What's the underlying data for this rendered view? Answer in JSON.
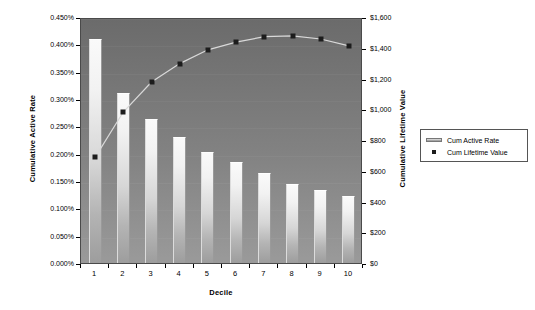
{
  "chart_data": {
    "type": "bar",
    "title": "",
    "xlabel": "Decile",
    "ylabel": "Cumulative Active Rate",
    "y2label": "Cumulative Lifetime Value",
    "categories": [
      "1",
      "2",
      "3",
      "4",
      "5",
      "6",
      "7",
      "8",
      "9",
      "10"
    ],
    "grid": false,
    "legend_position": "right",
    "ylim": [
      0,
      0.0045
    ],
    "y2lim": [
      0,
      1600
    ],
    "yticks": [
      "0.000%",
      "0.050%",
      "0.100%",
      "0.150%",
      "0.200%",
      "0.250%",
      "0.300%",
      "0.350%",
      "0.400%",
      "0.450%"
    ],
    "ytick_values": [
      0,
      0.0005,
      0.001,
      0.0015,
      0.002,
      0.0025,
      0.003,
      0.0035,
      0.004,
      0.0045
    ],
    "y2ticks": [
      "$0",
      "$200",
      "$400",
      "$600",
      "$800",
      "$1,000",
      "$1,200",
      "$1,400",
      "$1,600"
    ],
    "y2tick_values": [
      0,
      200,
      400,
      600,
      800,
      1000,
      1200,
      1400,
      1600
    ],
    "series": [
      {
        "name": "Cum Active Rate",
        "type": "bar",
        "axis": "left",
        "values": [
          0.0041,
          0.00311,
          0.00263,
          0.0023,
          0.00204,
          0.00184,
          0.00164,
          0.00144,
          0.00133,
          0.00123
        ],
        "value_labels": [
          "0.410%",
          "0.311%",
          "0.263%",
          "0.230%",
          "0.204%",
          "0.184%",
          "0.164%",
          "0.144%",
          "0.133%",
          "0.123%"
        ],
        "color": "#e6e6e6"
      },
      {
        "name": "Cum Lifetime Value",
        "type": "line",
        "axis": "right",
        "values": [
          700,
          995,
          1190,
          1310,
          1400,
          1450,
          1485,
          1490,
          1470,
          1425
        ],
        "value_labels": [
          "$700",
          "$995",
          "$1,190",
          "$1,310",
          "$1,400",
          "$1,450",
          "$1,485",
          "$1,490",
          "$1,470",
          "$1,425"
        ],
        "color": "#1c1c1c"
      }
    ]
  },
  "legend": {
    "items": [
      {
        "label": "Cum Active Rate",
        "marker": "bar-swatch"
      },
      {
        "label": "Cum Lifetime Value",
        "marker": "square-marker"
      }
    ]
  },
  "colors": {
    "plot_background_top": "#6b6b6b",
    "plot_background_bottom": "#9a9a9a",
    "bar_light": "#fafafa",
    "bar_dark": "#9d9d9d",
    "marker": "#1c1c1c",
    "page_background": "#ffffff"
  }
}
